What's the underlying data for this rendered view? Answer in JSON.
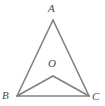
{
  "figure": {
    "type": "geometry-diagram",
    "canvas": {
      "width": 105,
      "height": 106,
      "background": "#ffffff"
    },
    "style": {
      "stroke_color": "#828282",
      "stroke_width": 1.6,
      "label_color": "#4a4a4a",
      "label_font_style": "italic"
    },
    "points": [
      {
        "id": "A",
        "label": "A",
        "x": 53,
        "y": 20,
        "label_x": 48,
        "label_y": 3,
        "role": "apex-vertex"
      },
      {
        "id": "B",
        "label": "B",
        "x": 17,
        "y": 96,
        "label_x": 2,
        "label_y": 90,
        "role": "base-left-vertex"
      },
      {
        "id": "C",
        "label": "C",
        "x": 89,
        "y": 96,
        "label_x": 92,
        "label_y": 91,
        "role": "base-right-vertex"
      },
      {
        "id": "O",
        "label": "O",
        "x": 53,
        "y": 76,
        "label_x": 48,
        "label_y": 58,
        "role": "interior-point"
      }
    ],
    "segments": [
      {
        "id": "AB",
        "from": "A",
        "to": "B"
      },
      {
        "id": "AC",
        "from": "A",
        "to": "C"
      },
      {
        "id": "BC",
        "from": "B",
        "to": "C"
      },
      {
        "id": "OB",
        "from": "O",
        "to": "B"
      },
      {
        "id": "OC",
        "from": "O",
        "to": "C"
      }
    ]
  }
}
